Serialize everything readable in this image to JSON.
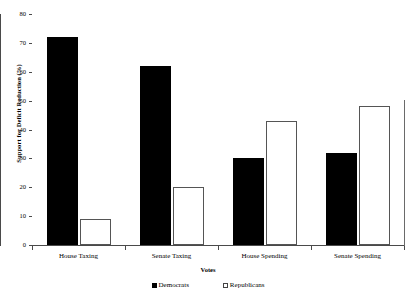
{
  "chart_data": {
    "type": "bar",
    "title": "",
    "xlabel": "Votes",
    "ylabel": "Support for Deficit Reduction (%)",
    "categories": [
      "House Taxing",
      "Senate Taxing",
      "House Spending",
      "Senate Spending"
    ],
    "series": [
      {
        "name": "Democrats",
        "color": "#000000",
        "values": [
          72,
          62,
          30,
          32
        ]
      },
      {
        "name": "Republicans",
        "color": "#ffffff",
        "values": [
          9,
          20,
          43,
          48
        ]
      }
    ],
    "ylim": [
      0,
      80
    ],
    "yticks": [
      0,
      10,
      20,
      30,
      40,
      50,
      60,
      70,
      80
    ],
    "ytick_labels": [
      "0",
      "10",
      "20",
      "30",
      "40",
      "50",
      "60",
      "70",
      "80"
    ],
    "grid": false,
    "legend_position": "bottom"
  },
  "legend": {
    "entries": [
      {
        "label": "Democrats",
        "swatch": "filled-square-icon"
      },
      {
        "label": "Republicans",
        "swatch": "open-square-icon"
      }
    ]
  }
}
